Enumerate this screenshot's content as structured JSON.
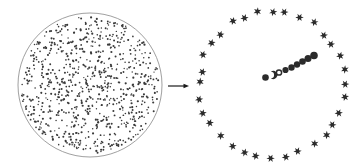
{
  "figure": {
    "background_color": "#ffffff",
    "width": 358,
    "height": 166
  },
  "left_panel": {
    "name": "uniform-dot-disc",
    "caption": "",
    "circle": {
      "center_x": 90,
      "center_y": 85,
      "radius": 72,
      "stroke_color": "#888888",
      "stroke_width": 0.8,
      "fill": "none"
    },
    "dots": {
      "count": 820,
      "color": "#3a3a3a",
      "radius": 0.85,
      "distribution": "uniform-random-in-disc",
      "seed": 20240517
    }
  },
  "arrow": {
    "name": "transformation-arrow",
    "label": "",
    "x1": 168,
    "y1": 86,
    "x2": 189,
    "y2": 86,
    "color": "#1a1a1a",
    "stroke_width": 1.2,
    "head_length": 5.5,
    "head_width": 4.5
  },
  "right_panel": {
    "name": "ring-and-chain",
    "caption": "",
    "ring": {
      "name": "star-ring",
      "center_x": 272,
      "center_y": 84,
      "radius": 73,
      "marker": "six-pointed-star",
      "marker_color": "#2b2b2b",
      "marker_size": 4.2,
      "count": 32,
      "start_angle_deg": 90,
      "jitter_radial": 2.4,
      "jitter_angular_deg": 2.0,
      "seed": 77
    },
    "chain": {
      "name": "central-dot-chain",
      "description": "diagonal chain of markers running up-right from ring center",
      "color": "#2b2b2b",
      "markers": [
        {
          "id": "c1",
          "type": "filled-circle",
          "x": 265.5,
          "y": 77.5,
          "r": 3.3
        },
        {
          "id": "c2",
          "type": "crescent",
          "x": 272.0,
          "y": 75.0,
          "r": 3.2
        },
        {
          "id": "c3",
          "type": "hollow-circle",
          "x": 279.0,
          "y": 72.5,
          "r": 3.3
        },
        {
          "id": "c4",
          "type": "filled-circle",
          "x": 285.5,
          "y": 70.0,
          "r": 3.1
        },
        {
          "id": "c5",
          "type": "filled-circle",
          "x": 291.5,
          "y": 67.5,
          "r": 3.2
        },
        {
          "id": "c6",
          "type": "filled-circle",
          "x": 297.0,
          "y": 64.5,
          "r": 3.2
        },
        {
          "id": "c7",
          "type": "filled-circle",
          "x": 302.5,
          "y": 61.5,
          "r": 3.3
        },
        {
          "id": "c8",
          "type": "filled-circle",
          "x": 308.0,
          "y": 58.5,
          "r": 3.5
        },
        {
          "id": "c9",
          "type": "filled-circle",
          "x": 314.0,
          "y": 55.5,
          "r": 3.8
        }
      ]
    }
  }
}
